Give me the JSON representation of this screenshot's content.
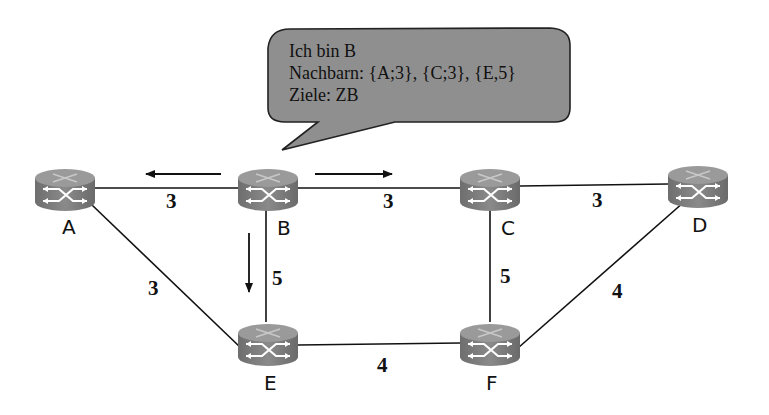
{
  "speech_bubble": {
    "speaker": "B",
    "lines": [
      "Ich bin B",
      "Nachbarn: {A;3}, {C;3}, {E,5}",
      "Ziele: ZB"
    ],
    "fill_color": "#8f8f8f",
    "border_color": "#222222"
  },
  "nodes": [
    {
      "id": "A",
      "label": "A",
      "x": 65,
      "y": 188
    },
    {
      "id": "B",
      "label": "B",
      "x": 268,
      "y": 188
    },
    {
      "id": "C",
      "label": "C",
      "x": 490,
      "y": 188
    },
    {
      "id": "D",
      "label": "D",
      "x": 698,
      "y": 185
    },
    {
      "id": "E",
      "label": "E",
      "x": 268,
      "y": 343
    },
    {
      "id": "F",
      "label": "F",
      "x": 490,
      "y": 343
    }
  ],
  "edges": [
    {
      "from": "A",
      "to": "B",
      "weight": "3"
    },
    {
      "from": "B",
      "to": "C",
      "weight": "3"
    },
    {
      "from": "C",
      "to": "D",
      "weight": "3"
    },
    {
      "from": "A",
      "to": "E",
      "weight": "3"
    },
    {
      "from": "B",
      "to": "E",
      "weight": "5"
    },
    {
      "from": "C",
      "to": "F",
      "weight": "5"
    },
    {
      "from": "D",
      "to": "F",
      "weight": "4"
    },
    {
      "from": "E",
      "to": "F",
      "weight": "4"
    }
  ],
  "broadcast_arrows": [
    {
      "from": "B",
      "toward": "A"
    },
    {
      "from": "B",
      "toward": "C"
    },
    {
      "from": "B",
      "toward": "E"
    }
  ],
  "router_color": "#7a7a7a"
}
